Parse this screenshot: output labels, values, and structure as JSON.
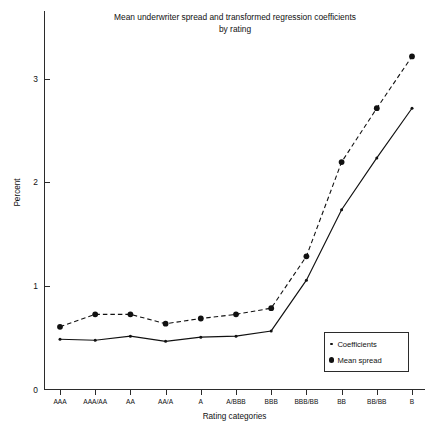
{
  "chart_data": {
    "type": "line",
    "title": "Mean underwriter spread and transformed regression coefficients by rating",
    "title_line1": "Mean underwriter spread and transformed regression coefficients",
    "title_line2": "by rating",
    "xlabel": "Rating categories",
    "ylabel": "Percent",
    "categories": [
      "AAA",
      "AAA/AA",
      "AA",
      "AA/A",
      "A",
      "A/BBB",
      "BBB",
      "BBB/BB",
      "BB",
      "BB/BB",
      "B"
    ],
    "ylim": [
      0,
      3.35
    ],
    "yticks": [
      0,
      1,
      2,
      3
    ],
    "ytick_labels": [
      "0",
      "1",
      "2",
      "3"
    ],
    "grid": false,
    "legend_position": "bottom-right",
    "series": [
      {
        "name": "Coefficients",
        "marker": "small-dot",
        "line_style": "solid",
        "color": "#111111",
        "values": [
          0.49,
          0.48,
          0.52,
          0.47,
          0.51,
          0.52,
          0.57,
          1.06,
          1.74,
          2.24,
          2.72
        ]
      },
      {
        "name": "Mean spread",
        "marker": "large-dot",
        "line_style": "dashed",
        "color": "#111111",
        "values": [
          0.61,
          0.73,
          0.73,
          0.64,
          0.69,
          0.73,
          0.79,
          1.29,
          2.2,
          2.72,
          3.22
        ]
      }
    ]
  },
  "legend": {
    "items": [
      {
        "label": "Coefficients",
        "marker": "small-dot"
      },
      {
        "label": "Mean spread",
        "marker": "large-dot"
      }
    ]
  }
}
